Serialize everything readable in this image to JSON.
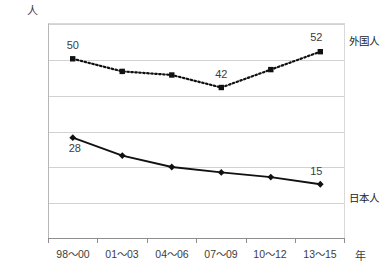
{
  "chart_data": {
    "type": "line",
    "title": "",
    "xlabel": "年",
    "ylabel": "人",
    "ylim": [
      0,
      60
    ],
    "yticks": [
      60,
      50,
      40,
      30,
      20,
      10,
      0
    ],
    "grid": true,
    "legend_position": "right-inline",
    "categories": [
      "98〜00",
      "01〜03",
      "04〜06",
      "07〜09",
      "10〜12",
      "13〜15"
    ],
    "series": [
      {
        "name": "外国人",
        "style": "dotted",
        "marker": "square",
        "color": "#111111",
        "values": [
          50,
          46.5,
          45.5,
          42,
          47,
          52
        ],
        "point_labels": [
          {
            "index": 0,
            "text": "50"
          },
          {
            "index": 3,
            "text": "42"
          },
          {
            "index": 5,
            "text": "52"
          }
        ]
      },
      {
        "name": "日本人",
        "style": "solid",
        "marker": "diamond",
        "color": "#111111",
        "values": [
          28,
          23,
          19.8,
          18.3,
          17,
          15
        ],
        "point_labels": [
          {
            "index": 0,
            "text": "28"
          },
          {
            "index": 5,
            "text": "15"
          }
        ]
      }
    ]
  },
  "axis": {
    "y_unit": "人",
    "x_unit": "年",
    "tick_0": "0",
    "tick_10": "10",
    "tick_20": "20",
    "tick_30": "30",
    "tick_40": "40",
    "tick_50": "50",
    "tick_60": "60"
  },
  "categories": {
    "c0": "98〜00",
    "c1": "01〜03",
    "c2": "04〜06",
    "c3": "07〜09",
    "c4": "10〜12",
    "c5": "13〜15"
  },
  "labels": {
    "foreign_series": "外国人",
    "japanese_series": "日本人",
    "foreign_first": "50",
    "foreign_min": "42",
    "foreign_last": "52",
    "japanese_first": "28",
    "japanese_last": "15"
  }
}
